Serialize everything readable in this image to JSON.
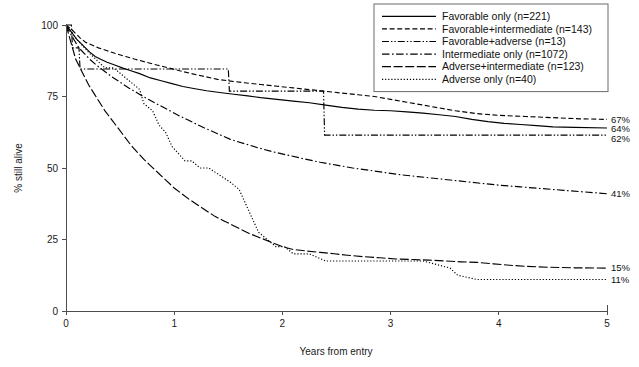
{
  "chart_data": {
    "type": "line",
    "title": "",
    "xlabel": "Years from entry",
    "ylabel": "% still alive",
    "xlim": [
      0,
      5
    ],
    "ylim": [
      0,
      100
    ],
    "xticks": [
      "0",
      "1",
      "2",
      "3",
      "4",
      "5"
    ],
    "xtick_values": [
      0,
      1,
      2,
      3,
      4,
      5
    ],
    "yticks": [
      "0",
      "25",
      "50",
      "75",
      "100"
    ],
    "ytick_values": [
      0,
      25,
      50,
      75,
      100
    ],
    "grid": false,
    "legend_position": "top-right",
    "series": [
      {
        "name": "Favorable only (n=221)",
        "label": "Favorable only",
        "n": 221,
        "dash": "none",
        "endpoint_label": "64%",
        "endpoint_value": 64,
        "points": [
          [
            0,
            100
          ],
          [
            0.04,
            98
          ],
          [
            0.07,
            96.5
          ],
          [
            0.1,
            95
          ],
          [
            0.14,
            93.5
          ],
          [
            0.18,
            92
          ],
          [
            0.22,
            90.5
          ],
          [
            0.27,
            89
          ],
          [
            0.32,
            88
          ],
          [
            0.38,
            87
          ],
          [
            0.45,
            86
          ],
          [
            0.52,
            85
          ],
          [
            0.6,
            84
          ],
          [
            0.68,
            83
          ],
          [
            0.78,
            81.5
          ],
          [
            0.88,
            80.5
          ],
          [
            0.98,
            79.5
          ],
          [
            1.08,
            78.5
          ],
          [
            1.18,
            77.8
          ],
          [
            1.3,
            77
          ],
          [
            1.42,
            76.4
          ],
          [
            1.55,
            75.8
          ],
          [
            1.68,
            75.2
          ],
          [
            1.8,
            74.6
          ],
          [
            1.95,
            74
          ],
          [
            2.1,
            73.4
          ],
          [
            2.25,
            72.8
          ],
          [
            2.4,
            72
          ],
          [
            2.55,
            71.2
          ],
          [
            2.7,
            70.6
          ],
          [
            2.85,
            70.2
          ],
          [
            3.0,
            70
          ],
          [
            3.15,
            69.6
          ],
          [
            3.3,
            69.2
          ],
          [
            3.45,
            68.6
          ],
          [
            3.6,
            68
          ],
          [
            3.75,
            67
          ],
          [
            3.9,
            66.2
          ],
          [
            4.05,
            65.6
          ],
          [
            4.2,
            65.2
          ],
          [
            4.35,
            64.8
          ],
          [
            4.5,
            64.4
          ],
          [
            4.7,
            64.2
          ],
          [
            5.0,
            64
          ]
        ]
      },
      {
        "name": "Favorable+intermediate (n=143)",
        "label": "Favorable+intermediate",
        "n": 143,
        "dash": "dashed",
        "endpoint_label": "67%",
        "endpoint_value": 67,
        "points": [
          [
            0,
            100
          ],
          [
            0.05,
            98.5
          ],
          [
            0.09,
            97
          ],
          [
            0.13,
            95.5
          ],
          [
            0.18,
            94
          ],
          [
            0.24,
            93
          ],
          [
            0.3,
            92
          ],
          [
            0.38,
            91
          ],
          [
            0.46,
            90
          ],
          [
            0.55,
            89
          ],
          [
            0.64,
            88
          ],
          [
            0.74,
            87
          ],
          [
            0.84,
            86
          ],
          [
            0.95,
            85
          ],
          [
            1.05,
            84
          ],
          [
            1.16,
            83
          ],
          [
            1.28,
            82
          ],
          [
            1.4,
            81
          ],
          [
            1.52,
            80.4
          ],
          [
            1.65,
            79.8
          ],
          [
            1.8,
            79.2
          ],
          [
            1.95,
            78.6
          ],
          [
            2.1,
            78
          ],
          [
            2.25,
            77.4
          ],
          [
            2.4,
            76.8
          ],
          [
            2.55,
            76.2
          ],
          [
            2.7,
            75.6
          ],
          [
            2.85,
            75
          ],
          [
            3.0,
            74
          ],
          [
            3.15,
            73
          ],
          [
            3.3,
            72
          ],
          [
            3.45,
            71
          ],
          [
            3.6,
            70
          ],
          [
            3.8,
            69
          ],
          [
            4.0,
            68.4
          ],
          [
            4.25,
            68
          ],
          [
            4.5,
            67.6
          ],
          [
            4.75,
            67.2
          ],
          [
            5.0,
            67
          ]
        ]
      },
      {
        "name": "Favorable+adverse (n=13)",
        "label": "Favorable+adverse",
        "n": 13,
        "dash": "dashdotdot",
        "endpoint_label": "62%",
        "endpoint_value": 62,
        "points": [
          [
            0,
            100
          ],
          [
            0.05,
            100
          ],
          [
            0.06,
            92
          ],
          [
            0.12,
            92
          ],
          [
            0.13,
            84.6
          ],
          [
            1.5,
            84.6
          ],
          [
            1.51,
            76.9
          ],
          [
            2.38,
            76.9
          ],
          [
            2.39,
            61.5
          ],
          [
            5.0,
            61.5
          ]
        ]
      },
      {
        "name": "Intermediate only (n=1072)",
        "label": "Intermediate only",
        "n": 1072,
        "dash": "dashdot",
        "endpoint_label": "41%",
        "endpoint_value": 41,
        "points": [
          [
            0,
            100
          ],
          [
            0.04,
            97
          ],
          [
            0.08,
            94.5
          ],
          [
            0.12,
            92
          ],
          [
            0.17,
            90
          ],
          [
            0.22,
            88
          ],
          [
            0.28,
            86
          ],
          [
            0.35,
            84
          ],
          [
            0.42,
            82
          ],
          [
            0.5,
            80
          ],
          [
            0.58,
            78
          ],
          [
            0.67,
            76
          ],
          [
            0.76,
            74
          ],
          [
            0.86,
            72
          ],
          [
            0.96,
            70
          ],
          [
            1.06,
            68
          ],
          [
            1.17,
            66
          ],
          [
            1.28,
            64
          ],
          [
            1.4,
            62
          ],
          [
            1.52,
            60
          ],
          [
            1.65,
            58.5
          ],
          [
            1.78,
            57
          ],
          [
            1.92,
            55.6
          ],
          [
            2.06,
            54.4
          ],
          [
            2.2,
            53.2
          ],
          [
            2.35,
            52
          ],
          [
            2.5,
            51
          ],
          [
            2.65,
            50
          ],
          [
            2.8,
            49.2
          ],
          [
            2.95,
            48.4
          ],
          [
            3.1,
            47.6
          ],
          [
            3.25,
            47
          ],
          [
            3.4,
            46.4
          ],
          [
            3.55,
            45.8
          ],
          [
            3.7,
            45.2
          ],
          [
            3.85,
            44.6
          ],
          [
            4.0,
            44
          ],
          [
            4.2,
            43.4
          ],
          [
            4.4,
            42.8
          ],
          [
            4.6,
            42.2
          ],
          [
            4.8,
            41.6
          ],
          [
            5.0,
            41
          ]
        ]
      },
      {
        "name": "Adverse+intermediate (n=123)",
        "label": "Adverse+intermediate",
        "n": 123,
        "dash": "longdash",
        "endpoint_label": "15%",
        "endpoint_value": 15,
        "points": [
          [
            0,
            100
          ],
          [
            0.03,
            96
          ],
          [
            0.06,
            92
          ],
          [
            0.09,
            88
          ],
          [
            0.13,
            85
          ],
          [
            0.17,
            82
          ],
          [
            0.21,
            79
          ],
          [
            0.26,
            76
          ],
          [
            0.31,
            73
          ],
          [
            0.36,
            70
          ],
          [
            0.42,
            67
          ],
          [
            0.48,
            64
          ],
          [
            0.54,
            61
          ],
          [
            0.6,
            58
          ],
          [
            0.66,
            55.5
          ],
          [
            0.72,
            53
          ],
          [
            0.79,
            50.5
          ],
          [
            0.86,
            48
          ],
          [
            0.93,
            45.5
          ],
          [
            1.0,
            43
          ],
          [
            1.07,
            41
          ],
          [
            1.14,
            39
          ],
          [
            1.22,
            37
          ],
          [
            1.3,
            35
          ],
          [
            1.38,
            33
          ],
          [
            1.46,
            31.5
          ],
          [
            1.54,
            30
          ],
          [
            1.62,
            28.5
          ],
          [
            1.7,
            27
          ],
          [
            1.8,
            25.5
          ],
          [
            1.9,
            24
          ],
          [
            2.0,
            22.5
          ],
          [
            2.1,
            21.5
          ],
          [
            2.22,
            21
          ],
          [
            2.35,
            20.5
          ],
          [
            2.48,
            20
          ],
          [
            2.6,
            19.5
          ],
          [
            2.75,
            19
          ],
          [
            2.9,
            18.6
          ],
          [
            3.05,
            18.2
          ],
          [
            3.2,
            18
          ],
          [
            3.35,
            17.8
          ],
          [
            3.5,
            17.5
          ],
          [
            3.65,
            17.2
          ],
          [
            3.8,
            17
          ],
          [
            3.95,
            16.5
          ],
          [
            4.1,
            16
          ],
          [
            4.25,
            15.6
          ],
          [
            4.45,
            15.3
          ],
          [
            4.7,
            15.1
          ],
          [
            5.0,
            15
          ]
        ]
      },
      {
        "name": "Adverse only (n=40)",
        "label": "Adverse only",
        "n": 40,
        "dash": "dotted",
        "endpoint_label": "11%",
        "endpoint_value": 11,
        "points": [
          [
            0,
            100
          ],
          [
            0.05,
            97.5
          ],
          [
            0.1,
            95
          ],
          [
            0.16,
            92.5
          ],
          [
            0.22,
            90
          ],
          [
            0.29,
            87.5
          ],
          [
            0.36,
            85
          ],
          [
            0.44,
            85
          ],
          [
            0.52,
            82.5
          ],
          [
            0.6,
            80
          ],
          [
            0.68,
            77.5
          ],
          [
            0.72,
            72.5
          ],
          [
            0.8,
            70
          ],
          [
            0.86,
            65
          ],
          [
            0.92,
            62.5
          ],
          [
            0.98,
            57.5
          ],
          [
            1.04,
            55
          ],
          [
            1.1,
            52.5
          ],
          [
            1.16,
            52.5
          ],
          [
            1.24,
            50
          ],
          [
            1.32,
            50
          ],
          [
            1.42,
            47.5
          ],
          [
            1.52,
            45
          ],
          [
            1.6,
            42.5
          ],
          [
            1.66,
            37.5
          ],
          [
            1.72,
            32.5
          ],
          [
            1.78,
            27.5
          ],
          [
            1.86,
            25
          ],
          [
            1.94,
            22.5
          ],
          [
            2.02,
            22.5
          ],
          [
            2.1,
            20
          ],
          [
            2.25,
            20
          ],
          [
            2.4,
            17.5
          ],
          [
            2.55,
            17.5
          ],
          [
            2.8,
            17.5
          ],
          [
            3.05,
            17.5
          ],
          [
            3.3,
            17.5
          ],
          [
            3.55,
            15
          ],
          [
            3.62,
            12.5
          ],
          [
            3.8,
            11
          ],
          [
            4.1,
            11
          ],
          [
            4.5,
            11
          ],
          [
            5.0,
            11
          ]
        ]
      }
    ]
  }
}
